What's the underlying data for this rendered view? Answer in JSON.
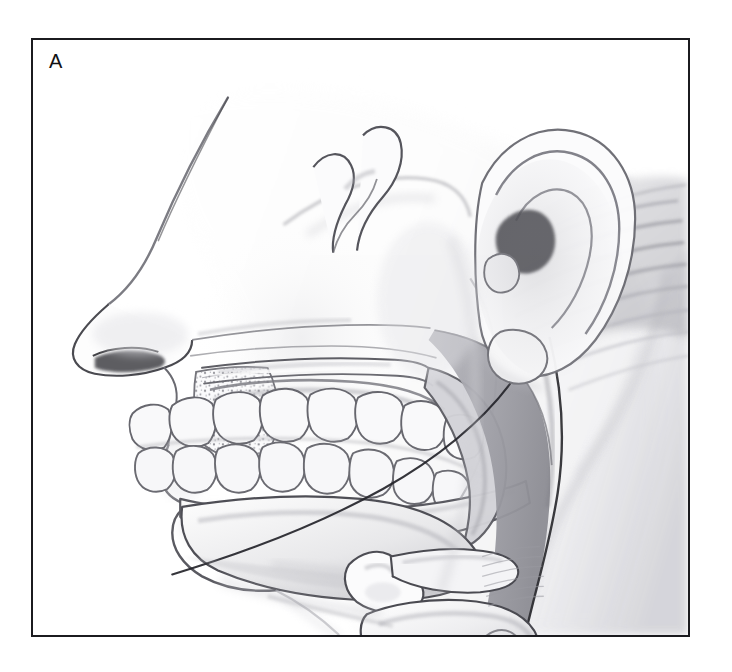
{
  "figure": {
    "panel_label": "A",
    "caption_present": false,
    "illustration_type": "medical-anatomical-line-drawing",
    "view": "midsagittal lateral profile of head and neck",
    "rendering_style": "graphite pencil / grayscale airbrush shading on white",
    "frame": {
      "border_color": "#1b1b1f",
      "border_width_px": 2,
      "background_color": "#ffffff",
      "x": 31,
      "y": 38,
      "width": 659,
      "height": 599
    }
  },
  "palette": {
    "background": "#ffffff",
    "outline_dark": "#2a2a2e",
    "outline_mid": "#5d5d62",
    "outline_soft": "#8e8e93",
    "skin_tint": "#f2f2f3",
    "skin_shadow": "#d9d9dc",
    "bone_fill": "#fbfbfb",
    "bone_shadow": "#dcdcdf",
    "tooth_fill": "#f7f7f8",
    "tooth_outline": "#6a6a70",
    "airway_gray": "#a9a9af",
    "airway_gray_dark": "#8a8a90",
    "soft_tissue": "#c9c9ce",
    "hair_gray": "#bdbdc2",
    "cartilage": "#ededef"
  },
  "anatomy": {
    "regions": [
      {
        "id": "facial-profile",
        "name": "Facial profile (forehead, nose, lips, chin)"
      },
      {
        "id": "nasal-cavity",
        "name": "Nasal cavity"
      },
      {
        "id": "maxillary-sinus",
        "name": "Maxilla with stippled cancellous bone"
      },
      {
        "id": "hard-palate",
        "name": "Hard palate"
      },
      {
        "id": "soft-palate",
        "name": "Soft palate / uvula"
      },
      {
        "id": "upper-dental-arch",
        "name": "Maxillary teeth"
      },
      {
        "id": "lower-dental-arch",
        "name": "Mandibular teeth"
      },
      {
        "id": "mandible",
        "name": "Mandible (body, ramus, condyle, coronoid process)"
      },
      {
        "id": "tongue",
        "name": "Tongue"
      },
      {
        "id": "nasopharynx",
        "name": "Nasopharyngeal airway"
      },
      {
        "id": "oropharynx",
        "name": "Oropharyngeal airway"
      },
      {
        "id": "hyoid-bone",
        "name": "Hyoid bone"
      },
      {
        "id": "epiglottis",
        "name": "Epiglottis"
      },
      {
        "id": "thyroid-cartilage",
        "name": "Thyroid cartilage"
      },
      {
        "id": "cricoid-cartilage",
        "name": "Cricoid cartilage"
      },
      {
        "id": "trachea",
        "name": "Trachea with cartilage rings"
      },
      {
        "id": "zygomatic-arch",
        "name": "Zygomatic arch"
      },
      {
        "id": "external-ear",
        "name": "External ear (auricle)"
      },
      {
        "id": "hair",
        "name": "Hair over occiput"
      },
      {
        "id": "neck-contour",
        "name": "Posterior neck contour"
      }
    ],
    "tooth_counts": {
      "upper_visible": 8,
      "lower_visible": 8
    },
    "tracheal_rings_visible": 3
  }
}
